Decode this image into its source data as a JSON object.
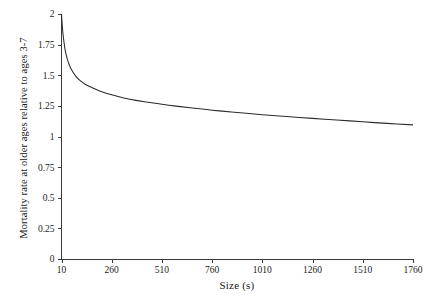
{
  "chart_data": {
    "type": "line",
    "title": "",
    "subtitle": "",
    "xlabel": "Size (s)",
    "ylabel": "Mortality rate at older ages relative to ages 3-7",
    "xlim": [
      10,
      1760
    ],
    "ylim": [
      0,
      2
    ],
    "grid": false,
    "legend": null,
    "xticks": [
      10,
      260,
      510,
      760,
      1010,
      1260,
      1510,
      1760
    ],
    "xtick_labels": [
      "10",
      "260",
      "510",
      "760",
      "1010",
      "1260",
      "1510",
      "1760"
    ],
    "yticks": [
      0,
      0.25,
      0.5,
      0.75,
      1,
      1.25,
      1.5,
      1.75,
      2
    ],
    "ytick_labels": [
      "0",
      "0.25",
      "0.5",
      "0.75",
      "1",
      "1.25",
      "1.5",
      "1.75",
      "2"
    ],
    "series": [
      {
        "name": "Mortality rate ratio",
        "x": [
          10,
          15,
          20,
          25,
          30,
          40,
          50,
          60,
          80,
          100,
          130,
          160,
          200,
          260,
          320,
          380,
          440,
          510,
          580,
          650,
          760,
          870,
          1010,
          1130,
          1260,
          1380,
          1510,
          1630,
          1760
        ],
        "y": [
          2.0,
          1.88,
          1.8,
          1.74,
          1.69,
          1.625,
          1.58,
          1.545,
          1.495,
          1.46,
          1.425,
          1.4,
          1.372,
          1.34,
          1.315,
          1.295,
          1.28,
          1.263,
          1.248,
          1.235,
          1.215,
          1.198,
          1.178,
          1.163,
          1.148,
          1.135,
          1.12,
          1.107,
          1.095
        ]
      }
    ]
  },
  "axis": {
    "x_title": "Size (s)",
    "y_title": "Mortality rate at older ages relative to ages 3-7"
  }
}
